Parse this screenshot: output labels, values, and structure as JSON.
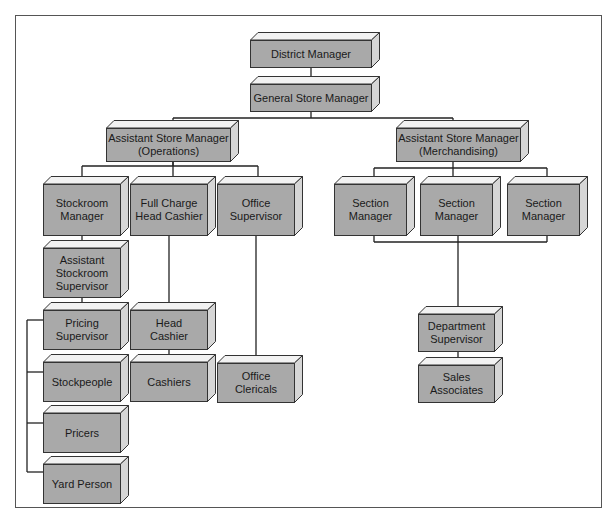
{
  "chart": {
    "colors": {
      "box_face": "#a9a9a9",
      "box_top": "#f2f2f2",
      "box_side": "#d6d6d6",
      "line": "#222222"
    }
  },
  "nodes": {
    "district_manager": {
      "label": "District Manager",
      "x": 250,
      "y": 32,
      "w": 122,
      "h": 28
    },
    "general_store_manager": {
      "label": "General Store Manager",
      "x": 250,
      "y": 76,
      "w": 122,
      "h": 28
    },
    "asm_operations": {
      "label": "Assistant Store Manager\n(Operations)",
      "x": 106,
      "y": 120,
      "w": 125,
      "h": 34
    },
    "asm_merchandising": {
      "label": "Assistant Store Manager\n(Merchandising)",
      "x": 396,
      "y": 120,
      "w": 125,
      "h": 34
    },
    "stockroom_manager": {
      "label": "Stockroom\nManager",
      "x": 43,
      "y": 176,
      "w": 78,
      "h": 52
    },
    "full_charge_head_cashier": {
      "label": "Full Charge\nHead Cashier",
      "x": 130,
      "y": 176,
      "w": 78,
      "h": 52
    },
    "office_supervisor": {
      "label": "Office\nSupervisor",
      "x": 217,
      "y": 176,
      "w": 78,
      "h": 52
    },
    "section_manager_1": {
      "label": "Section\nManager",
      "x": 334,
      "y": 176,
      "w": 73,
      "h": 52
    },
    "section_manager_2": {
      "label": "Section\nManager",
      "x": 420,
      "y": 176,
      "w": 73,
      "h": 52
    },
    "section_manager_3": {
      "label": "Section\nManager",
      "x": 507,
      "y": 176,
      "w": 73,
      "h": 52
    },
    "assistant_stockroom_supervisor": {
      "label": "Assistant\nStockroom\nSupervisor",
      "x": 43,
      "y": 240,
      "w": 78,
      "h": 50
    },
    "pricing_supervisor": {
      "label": "Pricing\nSupervisor",
      "x": 43,
      "y": 302,
      "w": 78,
      "h": 40
    },
    "stockpeople": {
      "label": "Stockpeople",
      "x": 43,
      "y": 354,
      "w": 78,
      "h": 40
    },
    "pricers": {
      "label": "Pricers",
      "x": 43,
      "y": 405,
      "w": 78,
      "h": 40
    },
    "yard_person": {
      "label": "Yard Person",
      "x": 43,
      "y": 456,
      "w": 78,
      "h": 40
    },
    "head_cashier": {
      "label": "Head\nCashier",
      "x": 130,
      "y": 302,
      "w": 78,
      "h": 40
    },
    "cashiers": {
      "label": "Cashiers",
      "x": 130,
      "y": 354,
      "w": 78,
      "h": 40
    },
    "office_clericals": {
      "label": "Office\nClericals",
      "x": 217,
      "y": 355,
      "w": 78,
      "h": 40
    },
    "department_supervisor": {
      "label": "Department\nSupervisor",
      "x": 418,
      "y": 306,
      "w": 77,
      "h": 38
    },
    "sales_associates": {
      "label": "Sales\nAssociates",
      "x": 418,
      "y": 357,
      "w": 77,
      "h": 38
    }
  },
  "edges": [
    [
      "district_manager",
      "general_store_manager"
    ],
    [
      "general_store_manager",
      "asm_operations"
    ],
    [
      "general_store_manager",
      "asm_merchandising"
    ],
    [
      "asm_operations",
      "stockroom_manager"
    ],
    [
      "asm_operations",
      "full_charge_head_cashier"
    ],
    [
      "asm_operations",
      "office_supervisor"
    ],
    [
      "asm_merchandising",
      "section_manager_1"
    ],
    [
      "asm_merchandising",
      "section_manager_2"
    ],
    [
      "asm_merchandising",
      "section_manager_3"
    ],
    [
      "stockroom_manager",
      "assistant_stockroom_supervisor"
    ],
    [
      "assistant_stockroom_supervisor",
      "pricing_supervisor"
    ],
    [
      "pricing_supervisor",
      "stockpeople"
    ],
    [
      "pricing_supervisor",
      "pricers"
    ],
    [
      "pricing_supervisor",
      "yard_person"
    ],
    [
      "full_charge_head_cashier",
      "head_cashier"
    ],
    [
      "head_cashier",
      "cashiers"
    ],
    [
      "office_supervisor",
      "office_clericals"
    ],
    [
      "section_manager_1",
      "department_supervisor"
    ],
    [
      "section_manager_2",
      "department_supervisor"
    ],
    [
      "section_manager_3",
      "department_supervisor"
    ],
    [
      "department_supervisor",
      "sales_associates"
    ]
  ]
}
